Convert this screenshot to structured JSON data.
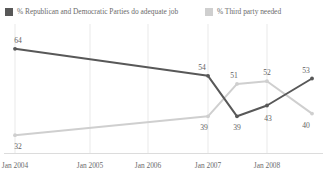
{
  "title_sliver": "",
  "legend": {
    "items": [
      {
        "label": "% Republican and Democratic Parties do adequate job",
        "color": "#585858",
        "swatch": "legend-swatch-dark"
      },
      {
        "label": "% Third party needed",
        "color": "#cfcfcf",
        "swatch": "legend-swatch-light"
      }
    ]
  },
  "axis": {
    "ticks": [
      "Jan 2004",
      "Jan 2005",
      "Jan 2006",
      "Jan 2007",
      "Jan 2008"
    ]
  },
  "chart_data": {
    "type": "line",
    "title": "",
    "subtitle": "",
    "xlabel": "",
    "ylabel": "",
    "x": [
      "Jan 2004",
      "Jan 2005",
      "Jan 2006",
      "Jan 2007",
      "Sep 2007",
      "Jan 2008",
      "Sep 2008"
    ],
    "categories": [
      "Jan 2004",
      "Jan 2005",
      "Jan 2006",
      "Jan 2007",
      "Jan 2008"
    ],
    "ylim": [
      28,
      68
    ],
    "grid": "vertical",
    "legend_position": "top",
    "series": [
      {
        "name": "% Republican and Democratic Parties do adequate job",
        "color": "#585858",
        "points": [
          {
            "x": "Jan 2004",
            "value": 64,
            "label": "64",
            "label_pos": "above"
          },
          {
            "x": "Jan 2007",
            "value": 54,
            "label": "54",
            "label_pos": "above"
          },
          {
            "x": "Sep 2007",
            "value": 39,
            "label": "39",
            "label_pos": "below"
          },
          {
            "x": "Jan 2008",
            "value": 43,
            "label": "43",
            "label_pos": "below"
          },
          {
            "x": "Sep 2008",
            "value": 53,
            "label": "53",
            "label_pos": "above"
          }
        ]
      },
      {
        "name": "% Third party needed",
        "color": "#cfcfcf",
        "points": [
          {
            "x": "Jan 2004",
            "value": 32,
            "label": "32",
            "label_pos": "below"
          },
          {
            "x": "Jan 2007",
            "value": 39,
            "label": "39",
            "label_pos": "below"
          },
          {
            "x": "Sep 2007",
            "value": 51,
            "label": "51",
            "label_pos": "above"
          },
          {
            "x": "Jan 2008",
            "value": 52,
            "label": "52",
            "label_pos": "above"
          },
          {
            "x": "Sep 2008",
            "value": 40,
            "label": "40",
            "label_pos": "below"
          }
        ]
      }
    ]
  }
}
